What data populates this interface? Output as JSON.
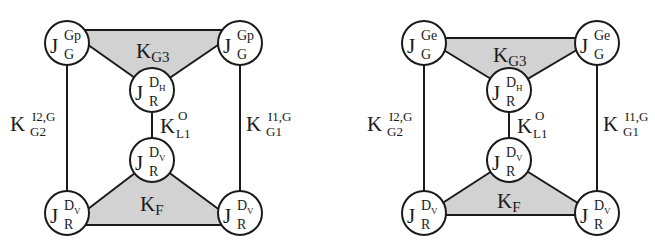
{
  "colors": {
    "line": "#1a1a1a",
    "fill_triangle": "#d2d2d2",
    "node_fill": "#ffffff",
    "background": "#ffffff"
  },
  "diagrams": [
    {
      "id": "left",
      "nodes": {
        "top_left": {
          "base": "J",
          "sup": "Gp",
          "sub": "G"
        },
        "top_right": {
          "base": "J",
          "sup": "Gp",
          "sub": "G"
        },
        "mid_top": {
          "base": "J",
          "sup": "D",
          "sup_sub": "H",
          "sub": "R"
        },
        "mid_bottom": {
          "base": "J",
          "sup": "D",
          "sup_sub": "V",
          "sub": "R"
        },
        "bottom_left": {
          "base": "J",
          "sup": "D",
          "sup_sub": "V",
          "sub": "R"
        },
        "bottom_right": {
          "base": "J",
          "sup": "D",
          "sup_sub": "V",
          "sub": "R"
        }
      },
      "labels": {
        "top_triangle": {
          "base": "K",
          "sub": "G3"
        },
        "bottom_triangle": {
          "base": "K",
          "sub": "F"
        },
        "center_edge": {
          "base": "K",
          "sup": "O",
          "sub": "L1"
        },
        "left_edge": {
          "base": "K",
          "sup": "I2,G",
          "sub": "G2"
        },
        "right_edge": {
          "base": "K",
          "sup": "I1,G",
          "sub": "G1"
        }
      }
    },
    {
      "id": "right",
      "nodes": {
        "top_left": {
          "base": "J",
          "sup": "Ge",
          "sub": "G"
        },
        "top_right": {
          "base": "J",
          "sup": "Ge",
          "sub": "G"
        },
        "mid_top": {
          "base": "J",
          "sup": "D",
          "sup_sub": "H",
          "sub": "R"
        },
        "mid_bottom": {
          "base": "J",
          "sup": "D",
          "sup_sub": "V",
          "sub": "R"
        },
        "bottom_left": {
          "base": "J",
          "sup": "D",
          "sup_sub": "V",
          "sub": "R"
        },
        "bottom_right": {
          "base": "J",
          "sup": "D",
          "sup_sub": "V",
          "sub": "R"
        }
      },
      "labels": {
        "top_triangle": {
          "base": "K",
          "sub": "G3"
        },
        "bottom_triangle": {
          "base": "K",
          "sub": "F"
        },
        "center_edge": {
          "base": "K",
          "sup": "O",
          "sub": "L1"
        },
        "left_edge": {
          "base": "K",
          "sup": "I2,G",
          "sub": "G2"
        },
        "right_edge": {
          "base": "K",
          "sup": "I1,G",
          "sub": "G1"
        }
      }
    }
  ]
}
